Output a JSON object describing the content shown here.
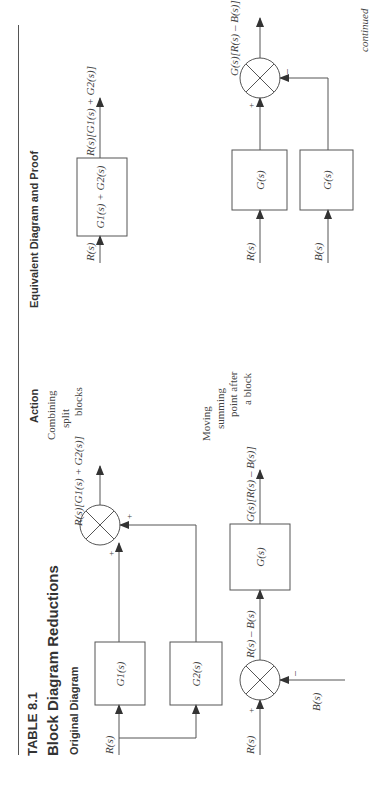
{
  "table": {
    "number": "TABLE 8.1",
    "title": "Block Diagram Reductions",
    "columns": {
      "original": "Original Diagram",
      "action": "Action",
      "equivalent": "Equivalent Diagram and Proof"
    },
    "continued_label": "continued"
  },
  "rows": [
    {
      "action_lines": [
        "Combining",
        "split",
        "blocks"
      ],
      "original": {
        "input": "R(s)",
        "block1": "G1(s)",
        "block2": "G2(s)",
        "sign1": "+",
        "sign2": "+",
        "output": "R(s)[G1(s) + G2(s)]"
      },
      "equivalent": {
        "input": "R(s)",
        "block": "G1(s) + G2(s)",
        "output": "R(s)[G1(s) + G2(s)]"
      }
    },
    {
      "action_lines": [
        "Moving",
        "summing",
        "point after",
        "a block"
      ],
      "original": {
        "input": "R(s)",
        "feedback_input": "B(s)",
        "sign_plus": "+",
        "sign_minus": "–",
        "summer_output": "R(s) – B(s)",
        "block": "G(s)",
        "output": "G(s)[R(s) – B(s)]"
      },
      "equivalent": {
        "input1": "R(s)",
        "input2": "B(s)",
        "block1": "G(s)",
        "block2": "G(s)",
        "sign_plus": "+",
        "sign_minus": "–",
        "output": "G(s)[R(s) – B(s)]"
      }
    }
  ],
  "colors": {
    "line": "#555555",
    "text": "#3a3a3a",
    "background": "#ffffff"
  }
}
